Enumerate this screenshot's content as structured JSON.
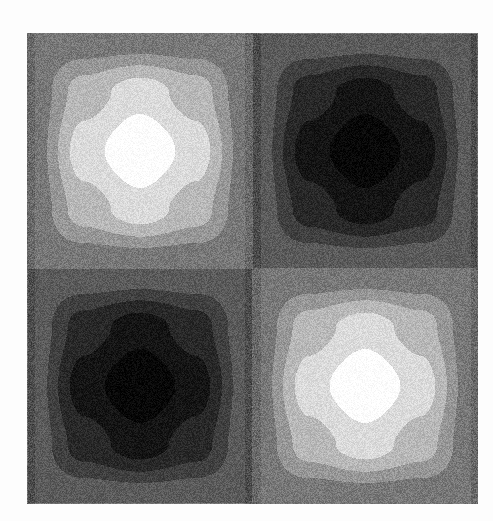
{
  "chart_data": {
    "type": "heatmap",
    "title": "",
    "xlabel": "",
    "ylabel": "",
    "colormap": "gray",
    "levels": 10,
    "style": "filled-contour, dithered grayscale",
    "grid": false,
    "legend": "none",
    "zlim": [
      -1,
      1
    ],
    "function_description": "2x2 checkerboard of extrema: peaks top-left and bottom-right, troughs top-right and bottom-left (z ~ sin(x)*sin(y))",
    "extrema": [
      {
        "label": "peak",
        "position": "top-left",
        "value": 1
      },
      {
        "label": "trough",
        "position": "top-right",
        "value": -1
      },
      {
        "label": "trough",
        "position": "bottom-left",
        "value": -1
      },
      {
        "label": "peak",
        "position": "bottom-right",
        "value": 1
      }
    ],
    "x": [
      0,
      0.125,
      0.25,
      0.375,
      0.5,
      0.625,
      0.75,
      0.875,
      1
    ],
    "y": [
      0,
      0.125,
      0.25,
      0.375,
      0.5,
      0.625,
      0.75,
      0.875,
      1
    ],
    "z": [
      [
        0,
        0,
        0,
        0,
        0,
        0,
        0,
        0,
        0
      ],
      [
        0,
        0.5,
        0.71,
        0.5,
        0,
        -0.5,
        -0.71,
        -0.5,
        0
      ],
      [
        0,
        0.71,
        1,
        0.71,
        0,
        -0.71,
        -1,
        -0.71,
        0
      ],
      [
        0,
        0.5,
        0.71,
        0.5,
        0,
        -0.5,
        -0.71,
        -0.5,
        0
      ],
      [
        0,
        0,
        0,
        0,
        0,
        0,
        0,
        0,
        0
      ],
      [
        0,
        -0.5,
        -0.71,
        -0.5,
        0,
        0.5,
        0.71,
        0.5,
        0
      ],
      [
        0,
        -0.71,
        -1,
        -0.71,
        0,
        0.71,
        1,
        0.71,
        0
      ],
      [
        0,
        -0.5,
        -0.71,
        -0.5,
        0,
        0.5,
        0.71,
        0.5,
        0
      ],
      [
        0,
        0,
        0,
        0,
        0,
        0,
        0,
        0,
        0
      ]
    ]
  },
  "plot": {
    "background": "#fdfdfd",
    "gray_min": "#050505",
    "gray_max": "#ffffff"
  }
}
